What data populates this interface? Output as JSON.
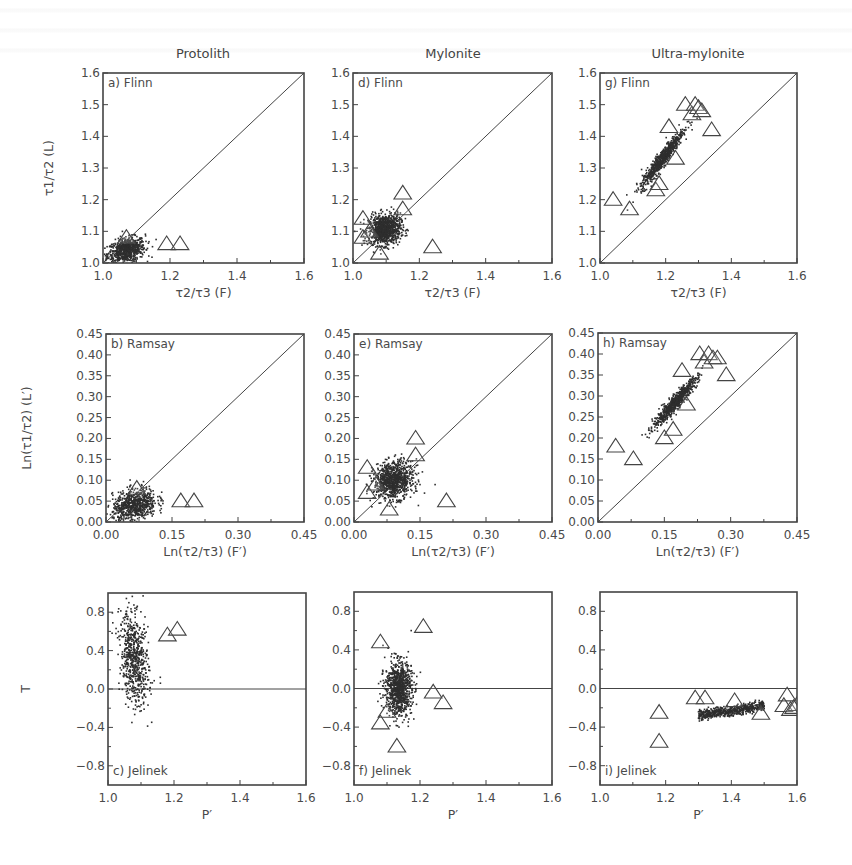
{
  "figure": {
    "column_titles": [
      "Protolith",
      "Mylonite",
      "Ultra-mylonite"
    ],
    "row_types": [
      "Flinn",
      "Ramsay",
      "Jelinek"
    ],
    "colors": {
      "ink": "#3a3a3a",
      "frame": "#444444",
      "scatter": "#2e2e2e",
      "background": "#ffffff"
    }
  },
  "chart_data": [
    {
      "id": "a",
      "panel_label": "a) Flinn",
      "column": "Protolith",
      "type": "scatter",
      "xlabel": "τ2/τ3 (F)",
      "ylabel": "τ1/τ2 (L)",
      "xlim": [
        1.0,
        1.6
      ],
      "ylim": [
        1.0,
        1.6
      ],
      "xticks": [
        "1.0",
        "1.2",
        "1.4",
        "1.6"
      ],
      "xtick_vals": [
        1.0,
        1.2,
        1.4,
        1.6
      ],
      "yticks": [
        "1.0",
        "1.1",
        "1.2",
        "1.3",
        "1.4",
        "1.5",
        "1.6"
      ],
      "ytick_vals": [
        1.0,
        1.1,
        1.2,
        1.3,
        1.4,
        1.5,
        1.6
      ],
      "reference_line": "diagonal",
      "cloud": {
        "cx": 1.07,
        "cy": 1.04,
        "sx": 0.028,
        "sy": 0.02,
        "corr": 0.3,
        "n": 700
      },
      "triangles": [
        [
          1.07,
          1.08
        ],
        [
          1.19,
          1.06
        ],
        [
          1.23,
          1.06
        ]
      ],
      "frame": [
        103,
        73,
        304,
        263
      ],
      "show_ylabel": true
    },
    {
      "id": "d",
      "panel_label": "d) Flinn",
      "column": "Mylonite",
      "type": "scatter",
      "xlabel": "τ2/τ3 (F)",
      "ylabel": "",
      "xlim": [
        1.0,
        1.6
      ],
      "ylim": [
        1.0,
        1.6
      ],
      "xticks": [
        "1.0",
        "1.2",
        "1.4",
        "1.6"
      ],
      "xtick_vals": [
        1.0,
        1.2,
        1.4,
        1.6
      ],
      "yticks": [
        "1.0",
        "1.1",
        "1.2",
        "1.3",
        "1.4",
        "1.5",
        "1.6"
      ],
      "ytick_vals": [
        1.0,
        1.1,
        1.2,
        1.3,
        1.4,
        1.5,
        1.6
      ],
      "reference_line": "diagonal",
      "cloud": {
        "cx": 1.095,
        "cy": 1.105,
        "sx": 0.024,
        "sy": 0.024,
        "corr": 0.1,
        "n": 900
      },
      "triangles": [
        [
          1.03,
          1.14
        ],
        [
          1.03,
          1.08
        ],
        [
          1.15,
          1.22
        ],
        [
          1.15,
          1.17
        ],
        [
          1.08,
          1.03
        ],
        [
          1.24,
          1.05
        ],
        [
          1.05,
          1.1
        ]
      ],
      "frame": [
        353,
        73,
        552,
        263
      ],
      "show_ylabel": false
    },
    {
      "id": "g",
      "panel_label": "g) Flinn",
      "column": "Ultra-mylonite",
      "type": "scatter",
      "xlabel": "τ2/τ3 (F)",
      "ylabel": "",
      "xlim": [
        1.0,
        1.6
      ],
      "ylim": [
        1.0,
        1.6
      ],
      "xticks": [
        "1.0",
        "1.2",
        "1.4",
        "1.6"
      ],
      "xtick_vals": [
        1.0,
        1.2,
        1.4,
        1.6
      ],
      "yticks": [
        "1.0",
        "1.1",
        "1.2",
        "1.3",
        "1.4",
        "1.5",
        "1.6"
      ],
      "ytick_vals": [
        1.0,
        1.1,
        1.2,
        1.3,
        1.4,
        1.5,
        1.6
      ],
      "reference_line": "diagonal",
      "cloud": {
        "cx": 1.19,
        "cy": 1.33,
        "sx": 0.032,
        "sy": 0.045,
        "corr": 0.95,
        "n": 700
      },
      "triangles": [
        [
          1.04,
          1.2
        ],
        [
          1.09,
          1.17
        ],
        [
          1.17,
          1.23
        ],
        [
          1.18,
          1.25
        ],
        [
          1.21,
          1.43
        ],
        [
          1.23,
          1.33
        ],
        [
          1.26,
          1.5
        ],
        [
          1.28,
          1.47
        ],
        [
          1.29,
          1.5
        ],
        [
          1.3,
          1.49
        ],
        [
          1.31,
          1.48
        ],
        [
          1.34,
          1.42
        ]
      ],
      "frame": [
        600,
        73,
        797,
        263
      ],
      "show_ylabel": false
    },
    {
      "id": "b",
      "panel_label": "b) Ramsay",
      "column": "Protolith",
      "type": "scatter",
      "xlabel": "Ln(τ2/τ3) (F′)",
      "ylabel": "Ln(τ1/τ2) (L′)",
      "xlim": [
        0.0,
        0.45
      ],
      "ylim": [
        0.0,
        0.45
      ],
      "xticks": [
        "0.00",
        "0.15",
        "0.30",
        "0.45"
      ],
      "xtick_vals": [
        0.0,
        0.15,
        0.3,
        0.45
      ],
      "yticks": [
        "0.00",
        "0.05",
        "0.10",
        "0.15",
        "0.20",
        "0.25",
        "0.30",
        "0.35",
        "0.40",
        "0.45"
      ],
      "ytick_vals": [
        0.0,
        0.05,
        0.1,
        0.15,
        0.2,
        0.25,
        0.3,
        0.35,
        0.4,
        0.45
      ],
      "reference_line": "diagonal",
      "cloud": {
        "cx": 0.065,
        "cy": 0.04,
        "sx": 0.025,
        "sy": 0.02,
        "corr": 0.3,
        "n": 700
      },
      "triangles": [
        [
          0.07,
          0.08
        ],
        [
          0.17,
          0.05
        ],
        [
          0.2,
          0.05
        ]
      ],
      "frame": [
        106,
        334,
        304,
        522
      ],
      "show_ylabel": true
    },
    {
      "id": "e",
      "panel_label": "e) Ramsay",
      "column": "Mylonite",
      "type": "scatter",
      "xlabel": "Ln(τ2/τ3) (F′)",
      "ylabel": "",
      "xlim": [
        0.0,
        0.45
      ],
      "ylim": [
        0.0,
        0.45
      ],
      "xticks": [
        "0.00",
        "0.15",
        "0.30",
        "0.45"
      ],
      "xtick_vals": [
        0.0,
        0.15,
        0.3,
        0.45
      ],
      "yticks": [
        "0.00",
        "0.05",
        "0.10",
        "0.15",
        "0.20",
        "0.25",
        "0.30",
        "0.35",
        "0.40",
        "0.45"
      ],
      "ytick_vals": [
        0.0,
        0.05,
        0.1,
        0.15,
        0.2,
        0.25,
        0.3,
        0.35,
        0.4,
        0.45
      ],
      "reference_line": "diagonal",
      "cloud": {
        "cx": 0.09,
        "cy": 0.1,
        "sx": 0.022,
        "sy": 0.022,
        "corr": 0.1,
        "n": 900
      },
      "triangles": [
        [
          0.03,
          0.13
        ],
        [
          0.03,
          0.07
        ],
        [
          0.14,
          0.2
        ],
        [
          0.14,
          0.16
        ],
        [
          0.08,
          0.03
        ],
        [
          0.21,
          0.05
        ],
        [
          0.05,
          0.09
        ]
      ],
      "frame": [
        354,
        334,
        552,
        522
      ],
      "show_ylabel": false
    },
    {
      "id": "h",
      "panel_label": "h) Ramsay",
      "column": "Ultra-mylonite",
      "type": "scatter",
      "xlabel": "Ln(τ2/τ3) (F′)",
      "ylabel": "",
      "xlim": [
        0.0,
        0.45
      ],
      "ylim": [
        0.0,
        0.45
      ],
      "xticks": [
        "0.00",
        "0.15",
        "0.30",
        "0.45"
      ],
      "xtick_vals": [
        0.0,
        0.15,
        0.3,
        0.45
      ],
      "yticks": [
        "0.00",
        "0.05",
        "0.10",
        "0.15",
        "0.20",
        "0.25",
        "0.30",
        "0.35",
        "0.40",
        "0.45"
      ],
      "ytick_vals": [
        0.0,
        0.05,
        0.1,
        0.15,
        0.2,
        0.25,
        0.3,
        0.35,
        0.4,
        0.45
      ],
      "reference_line": "diagonal",
      "cloud": {
        "cx": 0.175,
        "cy": 0.285,
        "sx": 0.025,
        "sy": 0.03,
        "corr": 0.95,
        "n": 700
      },
      "triangles": [
        [
          0.04,
          0.18
        ],
        [
          0.08,
          0.15
        ],
        [
          0.15,
          0.2
        ],
        [
          0.17,
          0.22
        ],
        [
          0.19,
          0.36
        ],
        [
          0.2,
          0.28
        ],
        [
          0.23,
          0.4
        ],
        [
          0.24,
          0.38
        ],
        [
          0.25,
          0.4
        ],
        [
          0.26,
          0.39
        ],
        [
          0.27,
          0.39
        ],
        [
          0.29,
          0.35
        ]
      ],
      "frame": [
        598,
        333,
        797,
        522
      ],
      "show_ylabel": false
    },
    {
      "id": "c",
      "panel_label": "c) Jelinek",
      "column": "Protolith",
      "type": "scatter",
      "xlabel": "P′",
      "ylabel": "T",
      "xlim": [
        1.0,
        1.6
      ],
      "ylim": [
        -1.0,
        1.0
      ],
      "xticks": [
        "1.0",
        "1.2",
        "1.4",
        "1.6"
      ],
      "xtick_vals": [
        1.0,
        1.2,
        1.4,
        1.6
      ],
      "yticks": [
        "−0.8",
        "−0.4",
        "0.0",
        "0.4",
        "0.8"
      ],
      "ytick_vals": [
        -0.8,
        -0.4,
        0.0,
        0.4,
        0.8
      ],
      "reference_line": "horizontal_zero",
      "cloud": {
        "cx": 1.08,
        "cy": 0.3,
        "sx": 0.022,
        "sy": 0.24,
        "corr": -0.3,
        "n": 650
      },
      "triangles": [
        [
          1.18,
          0.56
        ],
        [
          1.21,
          0.62
        ]
      ],
      "frame": [
        108,
        593,
        306,
        785
      ],
      "show_ylabel": true
    },
    {
      "id": "f",
      "panel_label": "f) Jelinek",
      "column": "Mylonite",
      "type": "scatter",
      "xlabel": "P′",
      "ylabel": "",
      "xlim": [
        1.0,
        1.6
      ],
      "ylim": [
        -1.0,
        1.0
      ],
      "xticks": [
        "1.0",
        "1.2",
        "1.4",
        "1.6"
      ],
      "xtick_vals": [
        1.0,
        1.2,
        1.4,
        1.6
      ],
      "yticks": [
        "−0.8",
        "−0.4",
        "0.0",
        "0.4",
        "0.8"
      ],
      "ytick_vals": [
        -0.8,
        -0.4,
        0.0,
        0.4,
        0.8
      ],
      "reference_line": "horizontal_zero",
      "cloud": {
        "cx": 1.135,
        "cy": 0.0,
        "sx": 0.02,
        "sy": 0.14,
        "corr": 0.0,
        "n": 900
      },
      "triangles": [
        [
          1.08,
          0.48
        ],
        [
          1.21,
          0.64
        ],
        [
          1.1,
          -0.24
        ],
        [
          1.08,
          -0.36
        ],
        [
          1.13,
          -0.6
        ],
        [
          1.24,
          -0.04
        ],
        [
          1.27,
          -0.15
        ]
      ],
      "frame": [
        354,
        592,
        552,
        785
      ],
      "show_ylabel": false
    },
    {
      "id": "i",
      "panel_label": "i) Jelinek",
      "column": "Ultra-mylonite",
      "type": "scatter",
      "xlabel": "P′",
      "ylabel": "",
      "xlim": [
        1.0,
        1.6
      ],
      "ylim": [
        -1.0,
        1.0
      ],
      "xticks": [
        "1.0",
        "1.2",
        "1.4",
        "1.6"
      ],
      "xtick_vals": [
        1.0,
        1.2,
        1.4,
        1.6
      ],
      "yticks": [
        "−0.8",
        "−0.4",
        "0.0",
        "0.4",
        "0.8"
      ],
      "ytick_vals": [
        -0.8,
        -0.4,
        0.0,
        0.4,
        0.8
      ],
      "reference_line": "horizontal_zero",
      "cloud": {
        "cx": 1.4,
        "cy": -0.23,
        "sx": 0.055,
        "sy": 0.025,
        "corr": 0.7,
        "n": 600,
        "xspan": [
          1.3,
          1.5
        ]
      },
      "triangles": [
        [
          1.18,
          -0.25
        ],
        [
          1.18,
          -0.55
        ],
        [
          1.29,
          -0.1
        ],
        [
          1.32,
          -0.1
        ],
        [
          1.41,
          -0.13
        ],
        [
          1.49,
          -0.26
        ],
        [
          1.57,
          -0.07
        ],
        [
          1.56,
          -0.18
        ],
        [
          1.58,
          -0.22
        ],
        [
          1.6,
          -0.17
        ],
        [
          1.59,
          -0.2
        ]
      ],
      "frame": [
        600,
        592,
        797,
        785
      ],
      "show_ylabel": false
    }
  ]
}
